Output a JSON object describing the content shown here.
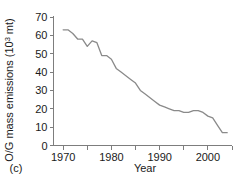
{
  "panel": {
    "label": "(c)"
  },
  "chart_data": {
    "type": "line",
    "title": "",
    "xlabel": "Year",
    "ylabel": "O/G mass emissions (10",
    "ylabel_sup": "3",
    "ylabel_tail": " mt)",
    "xlim": [
      1968,
      2005
    ],
    "ylim": [
      0,
      70
    ],
    "xticks": [
      1970,
      1975,
      1980,
      1985,
      1990,
      1995,
      2000,
      2005
    ],
    "xtick_labels": [
      "1970",
      "",
      "1980",
      "",
      "1990",
      "",
      "2000",
      ""
    ],
    "yticks": [
      0,
      10,
      20,
      30,
      40,
      50,
      60,
      70
    ],
    "ytick_labels": [
      "0",
      "10",
      "20",
      "30",
      "40",
      "50",
      "60",
      "70"
    ],
    "grid": false,
    "legend": "none",
    "line_color": "#8a8a8a",
    "axis_color": "#7d7d7d",
    "x": [
      1970,
      1971,
      1972,
      1973,
      1974,
      1975,
      1976,
      1977,
      1978,
      1979,
      1980,
      1981,
      1982,
      1983,
      1984,
      1985,
      1986,
      1987,
      1988,
      1989,
      1990,
      1991,
      1992,
      1993,
      1994,
      1995,
      1996,
      1997,
      1998,
      1999,
      2000,
      2001,
      2002,
      2003,
      2004
    ],
    "values": [
      63,
      63,
      61,
      58,
      58,
      54,
      57,
      56,
      49,
      49,
      47,
      42,
      40,
      38,
      36,
      34,
      30,
      28,
      26,
      24,
      22,
      21,
      20,
      19,
      19,
      18,
      18,
      19,
      19,
      18,
      16,
      15,
      11,
      7,
      7
    ]
  }
}
